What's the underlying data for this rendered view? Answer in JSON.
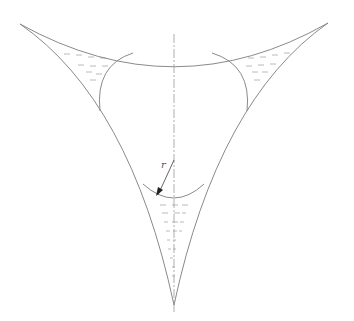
{
  "diagram": {
    "title": "",
    "labels": {
      "radius_label": "r"
    },
    "colors": {
      "line": "#8a8a8a",
      "axis": "#9a9a9a",
      "hatch": "#a8a8a8",
      "radius_arrow": "#555555",
      "background": "#ffffff"
    },
    "elements": {
      "cusps": [
        {
          "name": "top-left",
          "x": 20,
          "y": 24
        },
        {
          "name": "top-right",
          "x": 328,
          "y": 23
        },
        {
          "name": "bottom",
          "x": 174,
          "y": 305
        }
      ],
      "small_arcs": [
        "left",
        "right",
        "bottom"
      ],
      "hatched_regions": 3,
      "symmetry_axis": "vertical dash-dot"
    }
  }
}
